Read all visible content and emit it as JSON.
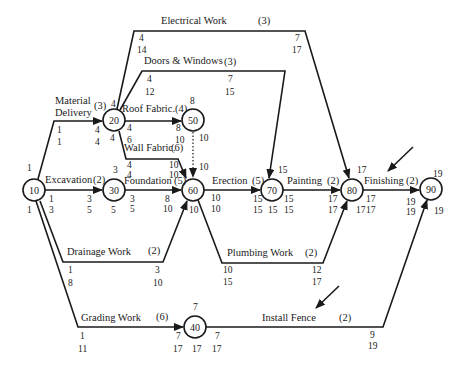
{
  "diagram": {
    "type": "activity-on-arrow network (CPM)",
    "nodes": [
      {
        "id": "10",
        "x": 34,
        "y": 190
      },
      {
        "id": "20",
        "x": 114,
        "y": 120
      },
      {
        "id": "30",
        "x": 114,
        "y": 190
      },
      {
        "id": "40",
        "x": 195,
        "y": 327
      },
      {
        "id": "50",
        "x": 193,
        "y": 120
      },
      {
        "id": "60",
        "x": 193,
        "y": 190
      },
      {
        "id": "70",
        "x": 272,
        "y": 190
      },
      {
        "id": "80",
        "x": 352,
        "y": 190
      },
      {
        "id": "90",
        "x": 431,
        "y": 189
      }
    ],
    "activities": [
      {
        "name": "Material Delivery",
        "name_line1": "Material",
        "name_line2": "Delivery",
        "duration": "(3)",
        "from": "10",
        "to": "20",
        "start_es": "1",
        "start_ls": "1",
        "end_ef": "4",
        "end_lf": "4"
      },
      {
        "name": "Electrical Work",
        "duration": "(3)",
        "from": "20",
        "to": "80",
        "start_es": "4",
        "start_ls": "14",
        "end_ef": "7",
        "end_lf": "17"
      },
      {
        "name": "Doors & Windows",
        "duration": "(3)",
        "from": "20",
        "to": "70",
        "start_es": "4",
        "start_ls": "12",
        "end_ef": "7",
        "end_lf": "15"
      },
      {
        "name": "Roof Fabric.",
        "duration": "(4)",
        "from": "20",
        "to": "50",
        "start_es": "4",
        "start_ls": "6",
        "end_ef": "8",
        "end_lf": "10"
      },
      {
        "name": "Wall Fabric.",
        "duration": "(6)",
        "from": "20",
        "to": "60",
        "start_es": "4",
        "start_ls": "4",
        "end_ef": "10",
        "end_lf": "10"
      },
      {
        "name": "Excavation",
        "duration": "(2)",
        "from": "10",
        "to": "30",
        "start_es": "1",
        "start_ls": "3",
        "end_ef": "3",
        "end_lf": "5"
      },
      {
        "name": "Foundation",
        "duration": "(5)",
        "from": "30",
        "to": "60",
        "start_es": "3",
        "start_ls": "5",
        "end_ef": "8",
        "end_lf": "10"
      },
      {
        "name": "Drainage Work",
        "duration": "(2)",
        "from": "10",
        "to": "60",
        "start_es": "1",
        "start_ls": "8",
        "end_ef": "3",
        "end_lf": "10"
      },
      {
        "name": "Erection",
        "duration": "(5)",
        "from": "60",
        "to": "70",
        "start_es": "10",
        "start_ls": "10",
        "end_ef": "15",
        "end_lf": "15"
      },
      {
        "name": "Plumbing Work",
        "duration": "(2)",
        "from": "60",
        "to": "80",
        "start_es": "10",
        "start_ls": "15",
        "end_ef": "12",
        "end_lf": "17"
      },
      {
        "name": "Painting",
        "duration": "(2)",
        "from": "70",
        "to": "80",
        "start_es": "15",
        "start_ls": "15",
        "end_ef": "17",
        "end_lf": "17"
      },
      {
        "name": "Finishing",
        "duration": "(2)",
        "from": "80",
        "to": "90",
        "start_es": "17",
        "start_ls": "17",
        "end_ef": "19",
        "end_lf": "19"
      },
      {
        "name": "Grading Work",
        "duration": "(6)",
        "from": "10",
        "to": "40",
        "start_es": "1",
        "start_ls": "11",
        "end_ef": "7",
        "end_lf": "17"
      },
      {
        "name": "Install Fence",
        "duration": "(2)",
        "from": "40",
        "to": "90",
        "start_es": "7",
        "start_ls": "17",
        "end_ef": "9",
        "end_lf": "19"
      },
      {
        "name": "Dummy",
        "duration": "",
        "from": "50",
        "to": "60",
        "dashed": true
      }
    ],
    "node_times": {
      "10": {
        "early": "1",
        "late": "1"
      },
      "20": {
        "early": "4",
        "late": "4"
      },
      "30": {
        "early": "3",
        "late": "5"
      },
      "40": {
        "early": "7",
        "late": "17"
      },
      "50": {
        "early": "8",
        "late": "10"
      },
      "60": {
        "early": "10",
        "late": "10"
      },
      "70": {
        "early": "15",
        "late": "15"
      },
      "80": {
        "early": "17",
        "late": "17"
      },
      "90": {
        "early": "19",
        "late": "19"
      }
    },
    "labels": {
      "electrical": "Electrical Work",
      "electrical_dur": "(3)",
      "doors": "Doors & Windows",
      "doors_dur": "(3)",
      "material1": "Material",
      "material2": "Delivery",
      "material_dur": "(3)",
      "roof": "Roof Fabric.",
      "roof_dur": "(4)",
      "wall": "Wall Fabric.",
      "wall_dur": "(6)",
      "excavation": "Excavation",
      "excavation_dur": "(2)",
      "foundation": "Foundation",
      "foundation_dur": "(5)",
      "erection": "Erection",
      "erection_dur": "(5)",
      "painting": "Painting",
      "painting_dur": "(2)",
      "finishing": "Finishing",
      "finishing_dur": "(2)",
      "drainage": "Drainage Work",
      "drainage_dur": "(2)",
      "plumbing": "Plumbing Work",
      "plumbing_dur": "(2)",
      "grading": "Grading Work",
      "grading_dur": "(6)",
      "fence": "Install Fence",
      "fence_dur": "(2)"
    },
    "numbers": {
      "e_s1": "4",
      "e_s2": "14",
      "e_e1": "7",
      "e_e2": "17",
      "d_s1": "4",
      "d_s2": "12",
      "d_e1": "7",
      "d_e2": "15",
      "m_s1": "1",
      "m_s2": "1",
      "m_e1": "4",
      "m_e2": "4",
      "n20_top": "4",
      "n20_bot": "4",
      "r_s1": "4",
      "r_s2": "6",
      "r_e1": "8",
      "r_e2": "10",
      "n50_top": "8",
      "n50_right": "10",
      "w_s1": "4",
      "w_s2": "4",
      "w_e1": "10",
      "w_e2": "10",
      "n10_top": "1",
      "n10_bot": "1",
      "x_s1": "1",
      "x_s2": "3",
      "x_e1": "3",
      "x_e2": "5",
      "n30_top": "3",
      "n30_bot": "5",
      "f_s1": "3",
      "f_s2": "5",
      "f_e1": "8",
      "f_e2": "10",
      "n60_top": "10",
      "n60_bot": "10",
      "er_s1": "10",
      "er_s2": "10",
      "er_e1": "15",
      "er_e2": "15",
      "n70_top": "15",
      "n70_bot": "15",
      "p_s1": "15",
      "p_s2": "15",
      "p_e1": "17",
      "p_e2": "17",
      "n80_top": "17",
      "n80_bot": "17",
      "fi_s1": "17",
      "fi_s2": "17",
      "fi_e1": "19",
      "fi_e2": "19",
      "n90_top": "19",
      "n90_bot": "19",
      "dr_s1": "1",
      "dr_s2": "8",
      "dr_e1": "3",
      "dr_e2": "10",
      "pl_s1": "10",
      "pl_s2": "15",
      "pl_e1": "12",
      "pl_e2": "17",
      "g_s1": "1",
      "g_s2": "11",
      "g_e1": "7",
      "g_e2": "17",
      "n40_top": "7",
      "n40_bot": "17",
      "fe_s1": "7",
      "fe_s2": "17",
      "fe_e1": "9",
      "fe_e2": "19"
    },
    "pointer_arrows": [
      {
        "points_to": "Finishing",
        "from": [
          413,
          147
        ],
        "to": [
          387,
          172
        ]
      },
      {
        "points_to": "Install Fence",
        "from": [
          338,
          286
        ],
        "to": [
          315,
          309
        ]
      }
    ],
    "colors": {
      "line": "#1a1a1a",
      "background": "#ffffff"
    }
  }
}
